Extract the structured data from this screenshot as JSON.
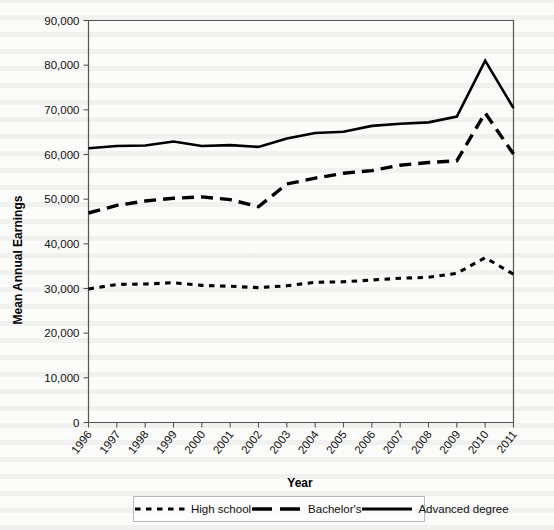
{
  "chart_data": {
    "type": "line",
    "title": "",
    "xlabel": "Year",
    "ylabel": "Mean Annual Earnings",
    "categories": [
      "1996",
      "1997",
      "1998",
      "1999",
      "2000",
      "2001",
      "2002",
      "2003",
      "2004",
      "2005",
      "2006",
      "2007",
      "2008",
      "2009",
      "2010",
      "2011"
    ],
    "x": [
      1996,
      1997,
      1998,
      1999,
      2000,
      2001,
      2002,
      2003,
      2004,
      2005,
      2006,
      2007,
      2008,
      2009,
      2010,
      2011
    ],
    "ylim": [
      0,
      90000
    ],
    "ytick_labels": [
      "0",
      "10,000",
      "20,000",
      "30,000",
      "40,000",
      "50,000",
      "60,000",
      "70,000",
      "80,000",
      "90,000"
    ],
    "ytick_values": [
      0,
      10000,
      20000,
      30000,
      40000,
      50000,
      60000,
      70000,
      80000,
      90000
    ],
    "grid": false,
    "legend_position": "bottom",
    "series": [
      {
        "name": "High school",
        "style": "dotted",
        "values": [
          29900,
          30900,
          31000,
          31300,
          30700,
          30500,
          30200,
          30600,
          31400,
          31500,
          31900,
          32300,
          32500,
          33400,
          36900,
          33200
        ]
      },
      {
        "name": "Bachelor's",
        "style": "dashed",
        "values": [
          46900,
          48600,
          49600,
          50200,
          50500,
          49900,
          48300,
          53400,
          54700,
          55800,
          56400,
          57600,
          58200,
          58600,
          69300,
          60100
        ]
      },
      {
        "name": "Advanced degree",
        "style": "solid",
        "values": [
          61400,
          61900,
          62000,
          62900,
          61900,
          62100,
          61700,
          63600,
          64800,
          65100,
          66400,
          66900,
          67200,
          68500,
          81000,
          70400
        ]
      }
    ]
  },
  "legend": {
    "items": [
      {
        "label": "High school",
        "style": "dotted"
      },
      {
        "label": "Bachelor's",
        "style": "dashed"
      },
      {
        "label": "Advanced degree",
        "style": "solid"
      }
    ]
  }
}
